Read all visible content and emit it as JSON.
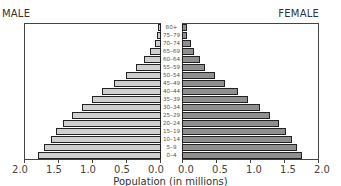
{
  "chart_data": {
    "type": "bar",
    "subtype": "population-pyramid",
    "title": "",
    "xlabel": "Population (in millions)",
    "ylabel": "",
    "left_title": "MALE",
    "right_title": "FEMALE",
    "xlim": [
      0,
      2.0
    ],
    "xticks_left": [
      "2.0",
      "1.5",
      "1.0",
      "0.5",
      "0.0"
    ],
    "xticks_right": [
      "0.0",
      "0.5",
      "1.0",
      "1.5",
      "2.0"
    ],
    "categories": [
      "80+",
      "75-79",
      "70-74",
      "65-69",
      "60-64",
      "55-59",
      "50-54",
      "45-49",
      "40-44",
      "35-39",
      "30-34",
      "25-29",
      "20-24",
      "15-19",
      "10-14",
      "5-9",
      "0-4"
    ],
    "series": [
      {
        "name": "Male",
        "color": "#cfcfcf",
        "values": [
          0.04,
          0.06,
          0.09,
          0.16,
          0.25,
          0.37,
          0.51,
          0.69,
          0.87,
          1.01,
          1.16,
          1.31,
          1.44,
          1.54,
          1.62,
          1.72,
          1.81
        ]
      },
      {
        "name": "Female",
        "color": "#8f8f8f",
        "values": [
          0.07,
          0.07,
          0.13,
          0.18,
          0.26,
          0.34,
          0.49,
          0.63,
          0.82,
          0.97,
          1.15,
          1.29,
          1.43,
          1.53,
          1.62,
          1.69,
          1.76
        ]
      }
    ],
    "grid": false,
    "legend": "none (panel titles MALE/FEMALE)"
  }
}
